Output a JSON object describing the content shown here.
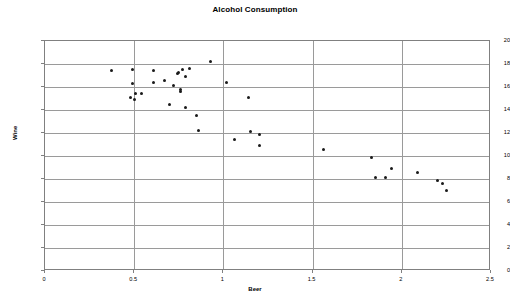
{
  "chart_data": {
    "type": "scatter",
    "title": "Alcohol Consumption",
    "xlabel": "Beer",
    "ylabel": "Wine",
    "xlim": [
      0,
      2.5
    ],
    "ylim": [
      0,
      20
    ],
    "grid": true,
    "legend": null,
    "xticks": [
      "0",
      "0.5",
      "1",
      "1.5",
      "2",
      "2.5"
    ],
    "xtick_values": [
      0,
      0.5,
      1,
      1.5,
      2,
      2.5
    ],
    "yticks": [
      "0",
      "2",
      "4",
      "6",
      "8",
      "10",
      "12",
      "14",
      "16",
      "18",
      "20"
    ],
    "ytick_values": [
      0,
      2,
      4,
      6,
      8,
      10,
      12,
      14,
      16,
      18,
      20
    ],
    "series": [
      {
        "name": "Countries",
        "marker": "diamond",
        "color": "#1a1a1a",
        "points": [
          {
            "x": 0.37,
            "y": 17.4
          },
          {
            "x": 0.48,
            "y": 15.1
          },
          {
            "x": 0.49,
            "y": 17.5
          },
          {
            "x": 0.49,
            "y": 16.3
          },
          {
            "x": 0.5,
            "y": 14.9
          },
          {
            "x": 0.51,
            "y": 15.4
          },
          {
            "x": 0.54,
            "y": 15.4
          },
          {
            "x": 0.61,
            "y": 17.4
          },
          {
            "x": 0.61,
            "y": 16.4
          },
          {
            "x": 0.67,
            "y": 16.6
          },
          {
            "x": 0.7,
            "y": 14.5
          },
          {
            "x": 0.72,
            "y": 16.1
          },
          {
            "x": 0.74,
            "y": 17.2
          },
          {
            "x": 0.75,
            "y": 17.3
          },
          {
            "x": 0.76,
            "y": 15.8
          },
          {
            "x": 0.76,
            "y": 15.6
          },
          {
            "x": 0.77,
            "y": 17.5
          },
          {
            "x": 0.79,
            "y": 14.2
          },
          {
            "x": 0.79,
            "y": 16.9
          },
          {
            "x": 0.81,
            "y": 17.6
          },
          {
            "x": 0.85,
            "y": 13.5
          },
          {
            "x": 0.86,
            "y": 12.2
          },
          {
            "x": 0.93,
            "y": 18.2
          },
          {
            "x": 1.02,
            "y": 16.4
          },
          {
            "x": 1.06,
            "y": 11.4
          },
          {
            "x": 1.14,
            "y": 15.1
          },
          {
            "x": 1.15,
            "y": 12.1
          },
          {
            "x": 1.2,
            "y": 11.9
          },
          {
            "x": 1.2,
            "y": 10.9
          },
          {
            "x": 1.56,
            "y": 10.6
          },
          {
            "x": 1.83,
            "y": 9.9
          },
          {
            "x": 1.85,
            "y": 8.1
          },
          {
            "x": 1.91,
            "y": 8.1
          },
          {
            "x": 1.94,
            "y": 8.9
          },
          {
            "x": 2.09,
            "y": 8.6
          },
          {
            "x": 2.2,
            "y": 7.9
          },
          {
            "x": 2.23,
            "y": 7.6
          },
          {
            "x": 2.25,
            "y": 7.0
          }
        ]
      }
    ]
  },
  "colors": {
    "marker": "#1a1a1a",
    "gridline": "#9a9a9a",
    "frame": "#808080",
    "text": "#000000",
    "background": "#ffffff"
  }
}
